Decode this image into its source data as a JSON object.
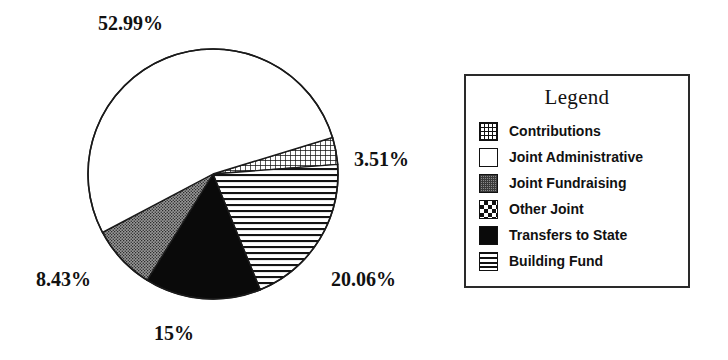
{
  "chart_data": {
    "type": "pie",
    "title": "",
    "legend_title": "Legend",
    "legend_position": "right",
    "grid": false,
    "categories": [
      "Contributions",
      "Joint Administrative",
      "Joint Fundraising",
      "Other Joint",
      "Transfers to State",
      "Building Fund"
    ],
    "values": [
      3.51,
      52.99,
      8.43,
      0,
      15,
      20.06
    ],
    "value_unit": "%",
    "slices": [
      {
        "label": "Contributions",
        "value": 3.51,
        "display": "3.51%",
        "pattern": "crosshatch",
        "start_angle": -17,
        "end_angle": -4.4
      },
      {
        "label": "Building Fund",
        "value": 20.06,
        "display": "20.06%",
        "pattern": "horizontal-lines",
        "start_angle": -4.4,
        "end_angle": 67.8
      },
      {
        "label": "Transfers to State",
        "value": 15,
        "display": "15%",
        "pattern": "solid-black",
        "start_angle": 67.8,
        "end_angle": 121.8
      },
      {
        "label": "Joint Fundraising",
        "value": 8.43,
        "display": "8.43%",
        "pattern": "gray-stipple",
        "start_angle": 121.8,
        "end_angle": 152.1
      },
      {
        "label": "Joint Administrative",
        "value": 52.99,
        "display": "52.99%",
        "pattern": "white",
        "start_angle": 152.1,
        "end_angle": 343
      },
      {
        "label": "Other Joint",
        "value": 0,
        "display": "",
        "pattern": "checkerboard",
        "start_angle": 343,
        "end_angle": 343
      }
    ],
    "labels": {
      "joint_administrative": "52.99%",
      "contributions": "3.51%",
      "building_fund": "20.06%",
      "transfers_to_state": "15%",
      "joint_fundraising": "8.43%"
    },
    "colors": {
      "outline": "#111111",
      "solid_black": "#0a0a0a",
      "gray_stipple": "#8a8a8a",
      "white": "#ffffff",
      "background": "#ffffff"
    }
  },
  "legend": {
    "title": "Legend",
    "items": [
      {
        "label": "Contributions",
        "pattern": "crosshatch",
        "swatch_icon": "crosshatch-swatch-icon"
      },
      {
        "label": "Joint Administrative",
        "pattern": "white",
        "swatch_icon": "white-swatch-icon"
      },
      {
        "label": "Joint Fundraising",
        "pattern": "gray-stipple",
        "swatch_icon": "stipple-swatch-icon"
      },
      {
        "label": "Other Joint",
        "pattern": "checkerboard",
        "swatch_icon": "checker-swatch-icon"
      },
      {
        "label": "Transfers to State",
        "pattern": "solid-black",
        "swatch_icon": "solid-swatch-icon"
      },
      {
        "label": "Building Fund",
        "pattern": "horizontal-lines",
        "swatch_icon": "hlines-swatch-icon"
      }
    ]
  }
}
